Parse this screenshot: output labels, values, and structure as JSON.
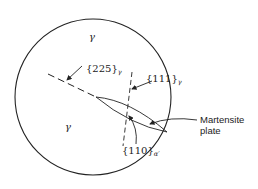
{
  "diagram": {
    "phase_labels": {
      "gamma_top": "γ",
      "gamma_bottom": "γ"
    },
    "planes": {
      "habit_plane": {
        "text": "{225}",
        "subscript": "γ"
      },
      "close_packed_austenite": {
        "text": "{111}",
        "subscript": "γ"
      },
      "close_packed_martensite": {
        "text": "{110}",
        "subscript": "α′"
      }
    },
    "callout": {
      "line1": "Martensite",
      "line2": "plate"
    },
    "colors": {
      "stroke": "#222222",
      "background": "#ffffff"
    }
  }
}
